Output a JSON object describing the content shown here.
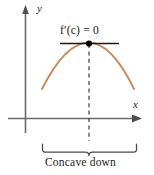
{
  "figure": {
    "axis_labels": {
      "x": "x",
      "y": "y"
    },
    "annotations": {
      "derivative_label": "f′(c) = 0",
      "derivative_label_parts": {
        "function": "f",
        "prime": "′",
        "argument": "(c)",
        "equals": "=",
        "value": "0"
      },
      "caption": "Concave down"
    },
    "colors": {
      "curve": "#c98b5e",
      "axis": "#6b6b6b",
      "tangent": "#1a1a1a",
      "dot": "#000000",
      "dashed": "#3a3a3a",
      "brace": "#4a4a4a",
      "text": "#1a1a1a",
      "background": "#ffffff"
    },
    "geometry": {
      "y_axis_x": 25,
      "y_axis_top": 8,
      "y_axis_bottom": 133,
      "x_axis_y": 118,
      "x_axis_left": 8,
      "x_axis_right": 141,
      "vertex_x": 89,
      "vertex_y": 43,
      "tangent_left": 60,
      "tangent_right": 119,
      "curve_left_x": 42,
      "curve_right_x": 134,
      "curve_end_y": 89,
      "dash_bottom": 140,
      "brace_left": 42,
      "brace_right": 137,
      "brace_y": 148
    }
  }
}
